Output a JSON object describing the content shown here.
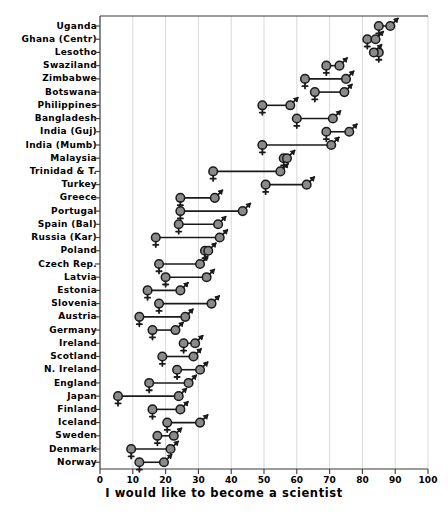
{
  "chart_data": {
    "type": "scatter",
    "title": "",
    "xlabel": "I would like to become a scientist",
    "ylabel": "",
    "xlim": [
      0,
      100
    ],
    "xticks": [
      0,
      10,
      20,
      30,
      40,
      50,
      60,
      70,
      80,
      90,
      100
    ],
    "grid": "vertical",
    "legend": "none",
    "series": [
      {
        "name": "female",
        "marker": "venus-symbol"
      },
      {
        "name": "male",
        "marker": "mars-symbol"
      }
    ],
    "categories": [
      "Uganda",
      "Ghana (Centr)",
      "Lesotho",
      "Swaziland",
      "Zimbabwe",
      "Botswana",
      "Philippines",
      "Bangladesh",
      "India (Guj)",
      "India (Mumb)",
      "Malaysia",
      "Trinidad & T.",
      "Turkey",
      "Greece",
      "Portugal",
      "Spain (Bal)",
      "Russia (Kar)",
      "Poland",
      "Czech Rep.",
      "Latvia",
      "Estonia",
      "Slovenia",
      "Austria",
      "Germany",
      "Ireland",
      "Scotland",
      "N. Ireland",
      "England",
      "Japan",
      "Finland",
      "Iceland",
      "Sweden",
      "Denmark",
      "Norway"
    ],
    "rows": [
      {
        "category": "Uganda",
        "female": 85.0,
        "male": 88.5
      },
      {
        "category": "Ghana (Centr)",
        "female": 81.5,
        "male": 84.0
      },
      {
        "category": "Lesotho",
        "female": 85.0,
        "male": 83.5
      },
      {
        "category": "Swaziland",
        "female": 69.0,
        "male": 73.0
      },
      {
        "category": "Zimbabwe",
        "female": 62.5,
        "male": 75.0
      },
      {
        "category": "Botswana",
        "female": 65.5,
        "male": 74.5
      },
      {
        "category": "Philippines",
        "female": 49.5,
        "male": 58.0
      },
      {
        "category": "Bangladesh",
        "female": 60.0,
        "male": 71.0
      },
      {
        "category": "India (Guj)",
        "female": 69.0,
        "male": 76.0
      },
      {
        "category": "India (Mumb)",
        "female": 49.5,
        "male": 70.5
      },
      {
        "category": "Malaysia",
        "female": 56.0,
        "male": 57.0
      },
      {
        "category": "Trinidad & T.",
        "female": 34.5,
        "male": 55.0
      },
      {
        "category": "Turkey",
        "female": 50.5,
        "male": 63.0
      },
      {
        "category": "Greece",
        "female": 24.5,
        "male": 35.0
      },
      {
        "category": "Portugal",
        "female": 24.5,
        "male": 43.5
      },
      {
        "category": "Spain (Bal)",
        "female": 24.0,
        "male": 36.0
      },
      {
        "category": "Russia (Kar)",
        "female": 17.0,
        "male": 36.5
      },
      {
        "category": "Poland",
        "female": 32.0,
        "male": 33.0
      },
      {
        "category": "Czech Rep.",
        "female": 18.0,
        "male": 30.5
      },
      {
        "category": "Latvia",
        "female": 20.0,
        "male": 32.5
      },
      {
        "category": "Estonia",
        "female": 14.5,
        "male": 24.5
      },
      {
        "category": "Slovenia",
        "female": 18.0,
        "male": 34.0
      },
      {
        "category": "Austria",
        "female": 12.0,
        "male": 26.0
      },
      {
        "category": "Germany",
        "female": 16.0,
        "male": 23.0
      },
      {
        "category": "Ireland",
        "female": 25.5,
        "male": 29.0
      },
      {
        "category": "Scotland",
        "female": 19.0,
        "male": 28.5
      },
      {
        "category": "N. Ireland",
        "female": 23.5,
        "male": 30.5
      },
      {
        "category": "England",
        "female": 15.0,
        "male": 27.0
      },
      {
        "category": "Japan",
        "female": 5.5,
        "male": 24.0
      },
      {
        "category": "Finland",
        "female": 16.0,
        "male": 24.5
      },
      {
        "category": "Iceland",
        "female": 20.5,
        "male": 30.5
      },
      {
        "category": "Sweden",
        "female": 17.5,
        "male": 22.5
      },
      {
        "category": "Denmark",
        "female": 9.5,
        "male": 21.5
      },
      {
        "category": "Norway",
        "female": 12.0,
        "male": 19.5
      }
    ]
  },
  "axes": {
    "x_title": "I would like to become a scientist",
    "x_tick_labels": [
      "0",
      "10",
      "20",
      "30",
      "40",
      "50",
      "60",
      "70",
      "80",
      "90",
      "100"
    ]
  },
  "colors": {
    "marker_fill": "#8a8a8a",
    "marker_stroke": "#1a1a1a",
    "gridline": "#cfcfcf",
    "axis": "#3a3a3a",
    "text": "#000000"
  }
}
